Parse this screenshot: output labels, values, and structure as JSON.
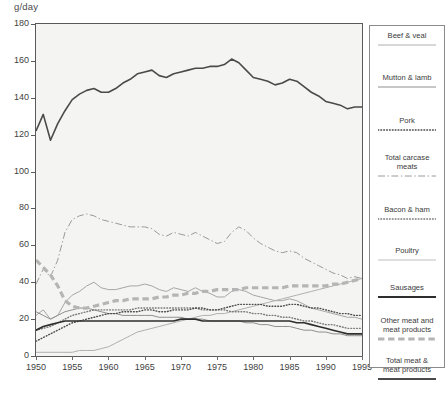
{
  "chart_data": {
    "type": "line",
    "title": "",
    "ylabel": "g/day",
    "xlabel": "",
    "ylim": [
      0,
      180
    ],
    "xlim": [
      1950,
      1995
    ],
    "yticks": [
      0,
      20,
      40,
      60,
      80,
      100,
      120,
      140,
      160,
      180
    ],
    "xticks": [
      1950,
      1955,
      1960,
      1965,
      1970,
      1975,
      1980,
      1985,
      1990,
      1995
    ],
    "grid": false,
    "legend_position": "right",
    "x": [
      1950,
      1951,
      1952,
      1953,
      1954,
      1955,
      1956,
      1957,
      1958,
      1959,
      1960,
      1961,
      1962,
      1963,
      1964,
      1965,
      1966,
      1967,
      1968,
      1969,
      1970,
      1971,
      1972,
      1973,
      1974,
      1975,
      1976,
      1977,
      1978,
      1979,
      1980,
      1981,
      1982,
      1983,
      1984,
      1985,
      1986,
      1987,
      1988,
      1989,
      1990,
      1991,
      1992,
      1993,
      1994,
      1995
    ],
    "series": [
      {
        "name": "Total meat & meat products",
        "style": "solid",
        "width": 1.6,
        "color": "#4a4a4a",
        "values": [
          122,
          131,
          117,
          126,
          133,
          139,
          142,
          144,
          145,
          143,
          143,
          145,
          148,
          150,
          153,
          154,
          155,
          152,
          151,
          153,
          154,
          155,
          156,
          156,
          157,
          157,
          158,
          161,
          159,
          155,
          151,
          150,
          149,
          147,
          148,
          150,
          149,
          146,
          143,
          141,
          138,
          137,
          136,
          134,
          135,
          135
        ]
      },
      {
        "name": "Total carcase meats",
        "style": "dashdot",
        "width": 1.0,
        "color": "#9a9a9a",
        "values": [
          39,
          47,
          43,
          52,
          67,
          74,
          76,
          77,
          76,
          74,
          73,
          72,
          71,
          70,
          70,
          70,
          69,
          66,
          65,
          67,
          66,
          65,
          67,
          65,
          63,
          61,
          62,
          67,
          70,
          68,
          64,
          61,
          59,
          57,
          56,
          57,
          56,
          53,
          51,
          49,
          47,
          45,
          44,
          42,
          43,
          42
        ]
      },
      {
        "name": "Beef & veal",
        "style": "solid",
        "width": 1.0,
        "color": "#a6a6a6",
        "values": [
          22,
          25,
          20,
          22,
          29,
          33,
          35,
          38,
          40,
          37,
          36,
          36,
          37,
          38,
          38,
          39,
          38,
          36,
          35,
          37,
          36,
          35,
          37,
          35,
          34,
          32,
          32,
          35,
          36,
          35,
          33,
          32,
          31,
          30,
          30,
          31,
          30,
          28,
          26,
          25,
          24,
          23,
          22,
          21,
          21,
          20
        ]
      },
      {
        "name": "Other meat and meat products",
        "style": "thickdash",
        "width": 3.2,
        "color": "#b5b5b5",
        "values": [
          52,
          48,
          44,
          38,
          30,
          27,
          26,
          26,
          27,
          28,
          29,
          30,
          30,
          31,
          31,
          31,
          31,
          32,
          32,
          33,
          33,
          34,
          34,
          35,
          35,
          36,
          36,
          36,
          36,
          37,
          37,
          37,
          37,
          37,
          37,
          38,
          38,
          38,
          38,
          38,
          38,
          39,
          39,
          40,
          41,
          42
        ]
      },
      {
        "name": "Pork",
        "style": "dotted",
        "width": 1.4,
        "color": "#4a4a4a",
        "values": [
          8,
          10,
          12,
          14,
          16,
          18,
          19,
          20,
          21,
          22,
          23,
          23,
          24,
          24,
          24,
          25,
          25,
          24,
          24,
          25,
          25,
          25,
          26,
          26,
          25,
          25,
          26,
          27,
          28,
          28,
          28,
          28,
          27,
          27,
          27,
          28,
          28,
          27,
          26,
          26,
          25,
          24,
          23,
          23,
          22,
          22
        ]
      },
      {
        "name": "Bacon & ham",
        "style": "dotted",
        "width": 1.4,
        "color": "#7a7a7a",
        "values": [
          14,
          15,
          16,
          18,
          20,
          22,
          23,
          24,
          25,
          25,
          25,
          25,
          25,
          25,
          26,
          26,
          26,
          26,
          26,
          26,
          26,
          26,
          26,
          25,
          25,
          25,
          25,
          24,
          24,
          24,
          23,
          23,
          22,
          22,
          21,
          21,
          20,
          19,
          19,
          18,
          17,
          17,
          16,
          15,
          15,
          15
        ]
      },
      {
        "name": "Sausages",
        "style": "solid",
        "width": 1.6,
        "color": "#2e2e2e",
        "values": [
          14,
          16,
          17,
          18,
          19,
          19,
          19,
          19,
          19,
          19,
          19,
          19,
          19,
          19,
          19,
          19,
          19,
          19,
          19,
          19,
          20,
          20,
          20,
          19,
          19,
          19,
          19,
          19,
          19,
          19,
          19,
          19,
          19,
          19,
          19,
          19,
          18,
          18,
          17,
          16,
          15,
          14,
          13,
          12,
          12,
          12
        ]
      },
      {
        "name": "Mutton & lamb",
        "style": "solid",
        "width": 1.0,
        "color": "#8f8f8f",
        "values": [
          24,
          22,
          20,
          22,
          24,
          25,
          26,
          26,
          25,
          24,
          23,
          23,
          22,
          22,
          22,
          22,
          22,
          21,
          21,
          21,
          21,
          20,
          20,
          20,
          19,
          19,
          19,
          19,
          19,
          18,
          18,
          17,
          17,
          16,
          16,
          16,
          15,
          14,
          14,
          13,
          13,
          12,
          12,
          11,
          11,
          11
        ]
      },
      {
        "name": "Poultry",
        "style": "solid",
        "width": 1.0,
        "color": "#b0b0b0",
        "values": [
          2,
          2,
          2,
          2,
          2,
          2,
          3,
          3,
          3,
          4,
          5,
          7,
          9,
          11,
          13,
          14,
          15,
          16,
          17,
          18,
          19,
          20,
          21,
          22,
          22,
          23,
          23,
          24,
          25,
          26,
          27,
          28,
          29,
          30,
          31,
          32,
          33,
          34,
          35,
          36,
          37,
          38,
          39,
          40,
          41,
          42
        ]
      }
    ],
    "legend_entries": [
      {
        "label": "Beef & veal",
        "style": "solid",
        "width": 1.2,
        "color": "#b0b0b0"
      },
      {
        "label": "Mutton & lamb",
        "style": "solid",
        "width": 1.2,
        "color": "#8f8f8f"
      },
      {
        "label": "Pork",
        "style": "dotted",
        "width": 1.4,
        "color": "#4a4a4a"
      },
      {
        "label": "Total carcase\nmeats",
        "style": "dashdot",
        "width": 1.0,
        "color": "#9a9a9a"
      },
      {
        "label": "Bacon & ham",
        "style": "dotted",
        "width": 1.4,
        "color": "#7a7a7a"
      },
      {
        "label": "Poultry",
        "style": "solid",
        "width": 1.2,
        "color": "#c0c0c0"
      },
      {
        "label": "Sausages",
        "style": "solid",
        "width": 2.0,
        "color": "#2e2e2e"
      },
      {
        "label": "Other meat and\nmeat products",
        "style": "thickdash",
        "width": 3.2,
        "color": "#b5b5b5"
      },
      {
        "label": "Total meat &\nmeat products",
        "style": "solid",
        "width": 2.0,
        "color": "#4a4a4a"
      }
    ]
  },
  "colors": {
    "plot_background": "#f4f4f2",
    "frame": "#5a5a5a",
    "text": "#3a3a3a",
    "legend_border": "#8a8a8a"
  }
}
